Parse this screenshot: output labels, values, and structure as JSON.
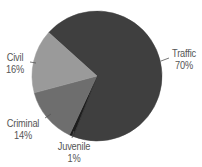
{
  "chart_data": {
    "type": "pie",
    "title": "",
    "start_angle_deg": 312,
    "direction": "clockwise",
    "center": [
      97,
      76
    ],
    "radius": 65,
    "slices": [
      {
        "label": "Traffic",
        "value": 70,
        "pct_label": "70%",
        "color": "#3f3f3f"
      },
      {
        "label": "Juvenile",
        "value": 1,
        "pct_label": "1%",
        "color": "#1e1e1e"
      },
      {
        "label": "Criminal",
        "value": 14,
        "pct_label": "14%",
        "color": "#6e6e6e"
      },
      {
        "label": "Civil",
        "value": 16,
        "pct_label": "16%",
        "color": "#9a9a9a"
      }
    ],
    "legend": "none (direct labels with leader lines)"
  },
  "labels": {
    "traffic": {
      "name": "Traffic",
      "pct": "70%"
    },
    "juvenile": {
      "name": "Juvenile",
      "pct": "1%"
    },
    "criminal": {
      "name": "Criminal",
      "pct": "14%"
    },
    "civil": {
      "name": "Civil",
      "pct": "16%"
    }
  }
}
